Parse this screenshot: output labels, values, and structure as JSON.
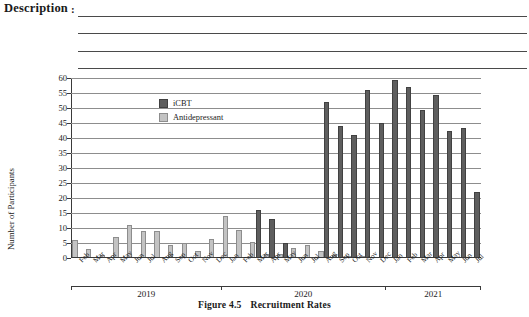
{
  "header": {
    "description_label": "Description",
    "colon": ":",
    "blank_rule_count": 4
  },
  "caption": {
    "figure_number": "Figure 4.5",
    "figure_title": "Recruitment Rates"
  },
  "legend": {
    "position": "top-left-inside",
    "entries": [
      {
        "label": "iCBT",
        "color": "#5e5e5e"
      },
      {
        "label": "Antidepressant",
        "color": "#c3c3c3"
      }
    ]
  },
  "axes": {
    "ylabel": "Number of Participants",
    "yticks": [
      0,
      5,
      10,
      15,
      20,
      25,
      30,
      35,
      40,
      45,
      50,
      55,
      60
    ],
    "ylim": [
      0,
      60
    ],
    "year_groups": [
      {
        "label": "2019",
        "start_index": 0,
        "end_index": 10
      },
      {
        "label": "2020",
        "start_index": 11,
        "end_index": 22
      },
      {
        "label": "2021",
        "start_index": 23,
        "end_index": 29
      }
    ]
  },
  "chart_data": {
    "type": "bar",
    "title": "Recruitment Rates",
    "xlabel": "",
    "ylabel": "Number of Participants",
    "ylim": [
      0,
      60
    ],
    "grid": true,
    "legend_position": "upper left",
    "categories": [
      "Feb",
      "Mar",
      "Apr",
      "May",
      "Jun",
      "Jul",
      "Aug",
      "Sep",
      "Oct",
      "Nov",
      "Dec",
      "Jan",
      "Feb",
      "Mar",
      "Apr",
      "May",
      "Jun",
      "Jul",
      "Aug",
      "Sep",
      "Oct",
      "Nov",
      "Dec",
      "Jan",
      "Feb",
      "Mar",
      "Apr",
      "May",
      "Jun",
      "Jul"
    ],
    "category_years": [
      "2019",
      "2019",
      "2019",
      "2019",
      "2019",
      "2019",
      "2019",
      "2019",
      "2019",
      "2019",
      "2019",
      "2020",
      "2020",
      "2020",
      "2020",
      "2020",
      "2020",
      "2020",
      "2020",
      "2020",
      "2020",
      "2020",
      "2020",
      "2021",
      "2021",
      "2021",
      "2021",
      "2021",
      "2021",
      "2021"
    ],
    "series": [
      {
        "name": "iCBT",
        "color": "#5e5e5e",
        "values": [
          0,
          0,
          0,
          0,
          0,
          0,
          0,
          0,
          0,
          0,
          0,
          0,
          0,
          16,
          13,
          5,
          0,
          0,
          52,
          44,
          41,
          56,
          45,
          59.5,
          57,
          49.5,
          54.5,
          42.5,
          43.5,
          22
        ]
      },
      {
        "name": "Antidepressant",
        "color": "#c3c3c3",
        "values": [
          6,
          3,
          1,
          7,
          11,
          9,
          9,
          4.5,
          5,
          2.5,
          6.5,
          14,
          9.5,
          5.5,
          1.5,
          1.5,
          3.5,
          4.5,
          2.5,
          1,
          0.7,
          0.5,
          0,
          0,
          0,
          0,
          0,
          0,
          0,
          0
        ]
      }
    ]
  }
}
